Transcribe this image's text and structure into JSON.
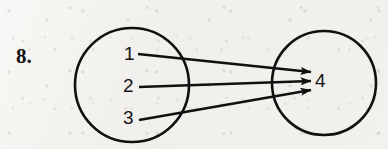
{
  "page": {
    "background_color": "#f2f0ec",
    "ink_color": "#101010",
    "width": 388,
    "height": 149
  },
  "exercise": {
    "number_label": "8.",
    "kind": "mapping-diagram"
  },
  "domain_set": {
    "name": "domain-circle",
    "center_x": 132,
    "center_y": 85,
    "radius": 57,
    "elements": [
      {
        "label": "1",
        "x": 124,
        "y": 44
      },
      {
        "label": "2",
        "x": 123,
        "y": 76
      },
      {
        "label": "3",
        "x": 123,
        "y": 108
      }
    ]
  },
  "codomain_set": {
    "name": "codomain-circle",
    "center_x": 324,
    "center_y": 83,
    "radius": 52,
    "elements": [
      {
        "label": "4",
        "x": 315,
        "y": 71
      }
    ]
  },
  "mappings": [
    {
      "from": "1",
      "to": "4",
      "x1": 138,
      "y1": 54,
      "x2": 311,
      "y2": 72
    },
    {
      "from": "2",
      "to": "4",
      "x1": 139,
      "y1": 87,
      "x2": 311,
      "y2": 81
    },
    {
      "from": "3",
      "to": "4",
      "x1": 139,
      "y1": 120,
      "x2": 311,
      "y2": 90
    }
  ]
}
